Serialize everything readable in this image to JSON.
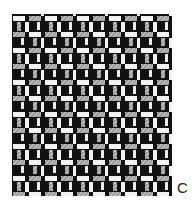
{
  "figure": {
    "panel_label": "C",
    "colors": {
      "background": "#ffffff",
      "dark": "#111111",
      "light_yarn": "#f2f2f2",
      "hatched_yarn": "#9a9a9a"
    }
  }
}
